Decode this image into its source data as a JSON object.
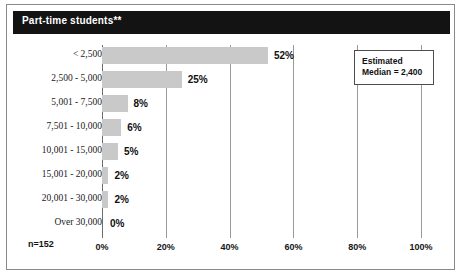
{
  "banner": {
    "title": "Part-time students**"
  },
  "annotation": {
    "line1": "Estimated",
    "line2": "Median = 2,400"
  },
  "sample_size": "n=152",
  "colors": {
    "bar": "#c9c9c9",
    "banner": "#131313",
    "grid": "#9a9a9a",
    "frame": "#8a8a8a",
    "text": "#101010"
  },
  "chart_data": {
    "type": "bar",
    "orientation": "horizontal",
    "title": "Part-time students**",
    "xlabel": "",
    "ylabel": "",
    "xlim": [
      0,
      100
    ],
    "grid": true,
    "legend": false,
    "categories": [
      "< 2,500",
      "2,500 - 5,000",
      "5,001 - 7,500",
      "7,501 - 10,000",
      "10,001 - 15,000",
      "15,001 - 20,000",
      "20,001 - 30,000",
      "Over 30,000"
    ],
    "values": [
      52,
      25,
      8,
      6,
      5,
      2,
      2,
      0
    ],
    "value_labels": [
      "52%",
      "25%",
      "8%",
      "6%",
      "5%",
      "2%",
      "2%",
      "0%"
    ],
    "xticks": [
      0,
      20,
      40,
      60,
      80,
      100
    ],
    "xtick_labels": [
      "0%",
      "20%",
      "40%",
      "60%",
      "80%",
      "100%"
    ],
    "annotations": [
      "Estimated Median = 2,400",
      "n=152"
    ]
  }
}
